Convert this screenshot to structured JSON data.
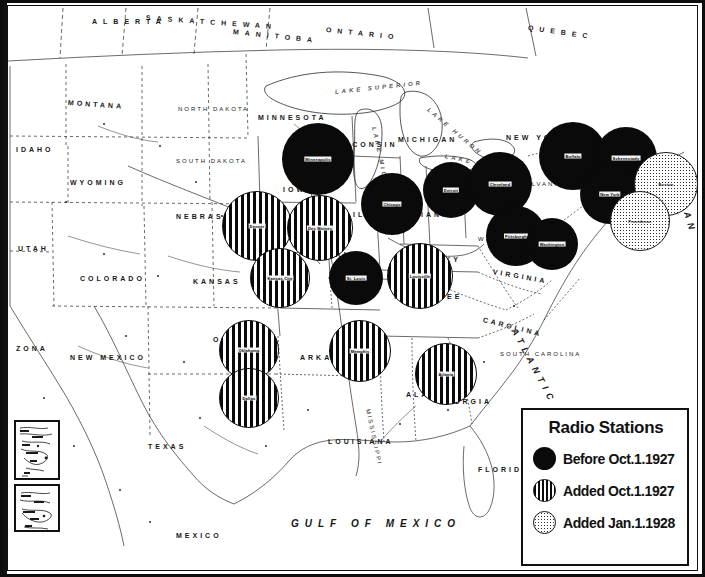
{
  "document": {
    "kind": "historical-map",
    "subject": "Radio broadcasting station coverage of the United States",
    "era": "1927-1928"
  },
  "legend": {
    "title": "Radio Stations",
    "entries": [
      {
        "marker": "solid-black-circle",
        "label": "Before Oct.1.1927"
      },
      {
        "marker": "vertical-striped-circle",
        "label": "Added Oct.1.1927"
      },
      {
        "marker": "stippled-circle",
        "label": "Added Jan.1.1928"
      }
    ]
  },
  "water_labels": [
    {
      "text": "GULF OF MEXICO",
      "x": 283,
      "y": 512,
      "style": "gulf",
      "rot": 0
    },
    {
      "text": "ATLANTIC",
      "x": 506,
      "y": 318,
      "style": "ocean",
      "rot": 62
    },
    {
      "text": "OCEAN",
      "x": 668,
      "y": 168,
      "style": "ocean",
      "rot": 72
    },
    {
      "text": "LAKE SUPERIOR",
      "x": 327,
      "y": 83,
      "style": "lake",
      "rot": -6
    },
    {
      "text": "LAKE MICHIGAN",
      "x": 366,
      "y": 118,
      "style": "lake",
      "rot": 78
    },
    {
      "text": "LAKE HURON",
      "x": 420,
      "y": 100,
      "style": "lake",
      "rot": 40
    },
    {
      "text": "LAKE ERIE",
      "x": 437,
      "y": 147,
      "style": "lake",
      "rot": 12
    }
  ],
  "province_labels": [
    {
      "text": "ALBERTA",
      "x": 84,
      "y": 12,
      "rot": 0
    },
    {
      "text": "SASKATCHEWAN",
      "x": 138,
      "y": 8,
      "rot": 4
    },
    {
      "text": "MANITOBA",
      "x": 225,
      "y": 22,
      "rot": 6
    },
    {
      "text": "ONTARIO",
      "x": 318,
      "y": 20,
      "rot": 6
    },
    {
      "text": "QUEBEC",
      "x": 520,
      "y": 18,
      "rot": 8
    }
  ],
  "state_labels": [
    {
      "text": "MONTANA",
      "x": 60,
      "y": 93,
      "rot": 4
    },
    {
      "text": "NORTH DAKOTA",
      "x": 170,
      "y": 100,
      "rot": 0
    },
    {
      "text": "SOUTH DAKOTA",
      "x": 168,
      "y": 152,
      "rot": 0
    },
    {
      "text": "WYOMING",
      "x": 62,
      "y": 173,
      "rot": 0
    },
    {
      "text": "IDAHO",
      "x": 8,
      "y": 140,
      "rot": 0
    },
    {
      "text": "NEBRASKA",
      "x": 168,
      "y": 207,
      "rot": 0
    },
    {
      "text": "UTAH",
      "x": 10,
      "y": 239,
      "rot": 0
    },
    {
      "text": "COLORADO",
      "x": 72,
      "y": 269,
      "rot": 0
    },
    {
      "text": "KANSAS",
      "x": 185,
      "y": 272,
      "rot": 0
    },
    {
      "text": "ZONA",
      "x": 8,
      "y": 339,
      "rot": 0
    },
    {
      "text": "NEW MEXICO",
      "x": 62,
      "y": 348,
      "rot": 0
    },
    {
      "text": "OKLAHOMA",
      "x": 205,
      "y": 330,
      "rot": 0
    },
    {
      "text": "ARKANSAS",
      "x": 292,
      "y": 348,
      "rot": 0
    },
    {
      "text": "TEXAS",
      "x": 140,
      "y": 437,
      "rot": 0
    },
    {
      "text": "LOUISIANA",
      "x": 320,
      "y": 432,
      "rot": 0
    },
    {
      "text": "MISSISSIPPI",
      "x": 360,
      "y": 400,
      "rot": 78
    },
    {
      "text": "ALABAMA",
      "x": 398,
      "y": 385,
      "rot": 0
    },
    {
      "text": "GEORGIA",
      "x": 430,
      "y": 392,
      "rot": 0
    },
    {
      "text": "MINNESOTA",
      "x": 250,
      "y": 108,
      "rot": 0
    },
    {
      "text": "IOWA",
      "x": 275,
      "y": 180,
      "rot": 0
    },
    {
      "text": "MISSOURI",
      "x": 282,
      "y": 245,
      "rot": 0
    },
    {
      "text": "ILLINOIS",
      "x": 345,
      "y": 205,
      "rot": 0
    },
    {
      "text": "WISCONSIN",
      "x": 322,
      "y": 135,
      "rot": 0
    },
    {
      "text": "MICHIGAN",
      "x": 390,
      "y": 130,
      "rot": 0
    },
    {
      "text": "INDIANA",
      "x": 392,
      "y": 205,
      "rot": 0
    },
    {
      "text": "OHIO",
      "x": 425,
      "y": 190,
      "rot": 0
    },
    {
      "text": "KENTUCKY",
      "x": 390,
      "y": 250,
      "rot": 0
    },
    {
      "text": "TENNESSEE",
      "x": 385,
      "y": 287,
      "rot": 0
    },
    {
      "text": "WEST VIRGINIA",
      "x": 470,
      "y": 230,
      "rot": 0
    },
    {
      "text": "VIRGINIA",
      "x": 485,
      "y": 262,
      "rot": 10
    },
    {
      "text": "CAROLINA",
      "x": 475,
      "y": 310,
      "rot": 14
    },
    {
      "text": "SOUTH CAROLINA",
      "x": 492,
      "y": 345,
      "rot": 0
    },
    {
      "text": "FLORIDA",
      "x": 470,
      "y": 460,
      "rot": 0
    },
    {
      "text": "PENNSYLVANIA",
      "x": 487,
      "y": 175,
      "rot": 0
    },
    {
      "text": "NEW YORK",
      "x": 498,
      "y": 128,
      "rot": 0
    },
    {
      "text": "MEXICO",
      "x": 168,
      "y": 526,
      "rot": 0
    }
  ],
  "stations": [
    {
      "id": "s01",
      "city": "Minneapolis",
      "class": "before",
      "cx": 310,
      "cy": 153,
      "r": 36
    },
    {
      "id": "s02",
      "city": "Chicago",
      "class": "before",
      "cx": 384,
      "cy": 198,
      "r": 31
    },
    {
      "id": "s03",
      "city": "Detroit",
      "class": "before",
      "cx": 443,
      "cy": 184,
      "r": 28
    },
    {
      "id": "s04",
      "city": "Cleveland",
      "class": "before",
      "cx": 492,
      "cy": 178,
      "r": 32
    },
    {
      "id": "s05",
      "city": "Pittsburgh",
      "class": "before",
      "cx": 508,
      "cy": 230,
      "r": 30
    },
    {
      "id": "s06",
      "city": "Buffalo",
      "class": "before",
      "cx": 565,
      "cy": 150,
      "r": 34
    },
    {
      "id": "s07",
      "city": "Schenectady",
      "class": "before",
      "cx": 618,
      "cy": 152,
      "r": 31
    },
    {
      "id": "s08",
      "city": "New York",
      "class": "before",
      "cx": 602,
      "cy": 188,
      "r": 30
    },
    {
      "id": "s09",
      "city": "Washington",
      "class": "before",
      "cx": 544,
      "cy": 238,
      "r": 26
    },
    {
      "id": "s10",
      "city": "St. Louis",
      "class": "before",
      "cx": 348,
      "cy": 272,
      "r": 27
    },
    {
      "id": "s11",
      "city": "Boston",
      "class": "added28",
      "cx": 658,
      "cy": 178,
      "r": 32
    },
    {
      "id": "s12",
      "city": "Providence",
      "class": "added28",
      "cx": 632,
      "cy": 215,
      "r": 30
    },
    {
      "id": "s13",
      "city": "Denver",
      "class": "added27",
      "cx": 249,
      "cy": 220,
      "r": 35
    },
    {
      "id": "s14",
      "city": "Des Moines",
      "class": "added27",
      "cx": 312,
      "cy": 222,
      "r": 33
    },
    {
      "id": "s15",
      "city": "Kansas City",
      "class": "added27",
      "cx": 272,
      "cy": 272,
      "r": 30
    },
    {
      "id": "s16",
      "city": "Louisville",
      "class": "added27",
      "cx": 412,
      "cy": 270,
      "r": 33
    },
    {
      "id": "s17",
      "city": "Oklahoma",
      "class": "added27",
      "cx": 241,
      "cy": 344,
      "r": 30
    },
    {
      "id": "s18",
      "city": "Dallas",
      "class": "added27",
      "cx": 241,
      "cy": 392,
      "r": 30
    },
    {
      "id": "s19",
      "city": "Memphis",
      "class": "added27",
      "cx": 352,
      "cy": 345,
      "r": 31
    },
    {
      "id": "s20",
      "city": "Atlanta",
      "class": "added27",
      "cx": 438,
      "cy": 368,
      "r": 31
    },
    {
      "id": "s21",
      "city": "Charlotte",
      "class": "added27",
      "cx": 468,
      "cy": 195,
      "r": 0
    }
  ],
  "insets": [
    {
      "id": "inset-a",
      "name": "inset-map-upper"
    },
    {
      "id": "inset-b",
      "name": "inset-map-lower"
    }
  ],
  "credit": {
    "text": ""
  }
}
